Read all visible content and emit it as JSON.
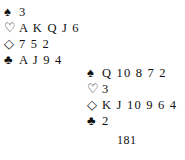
{
  "hands": {
    "north": {
      "spades": {
        "symbol": "♠",
        "cards": "3"
      },
      "hearts": {
        "symbol": "♡",
        "cards": "A K Q J 6"
      },
      "diamonds": {
        "symbol": "◇",
        "cards": "7 5 2"
      },
      "clubs": {
        "symbol": "♣",
        "cards": "A J 9 4"
      }
    },
    "south": {
      "spades": {
        "symbol": "♠",
        "cards": "Q 10 8 7 2"
      },
      "hearts": {
        "symbol": "♡",
        "cards": "3"
      },
      "diamonds": {
        "symbol": "◇",
        "cards": "K J 10 9 6 4"
      },
      "clubs": {
        "symbol": "♣",
        "cards": "2"
      }
    }
  },
  "page_number": "181"
}
